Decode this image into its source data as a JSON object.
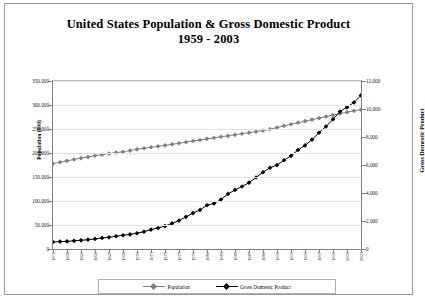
{
  "title": {
    "line1": "United States Population & Gross Domestic Product",
    "line2": "1959 - 2003"
  },
  "legend": {
    "items": [
      {
        "label": "Population",
        "color": "#808080"
      },
      {
        "label": "Gross Domestic Product",
        "color": "#000000"
      }
    ]
  },
  "chart_data": {
    "type": "line",
    "title": "United States Population & Gross Domestic Product 1959 - 2003",
    "xlabel": "",
    "ylabel": "Population (000)",
    "ylabel_right": "Gross Domestic Product",
    "grid": true,
    "legend_position": "bottom",
    "x": [
      1959,
      1960,
      1961,
      1962,
      1963,
      1964,
      1965,
      1966,
      1967,
      1968,
      1969,
      1970,
      1971,
      1972,
      1973,
      1974,
      1975,
      1976,
      1977,
      1978,
      1979,
      1980,
      1981,
      1982,
      1983,
      1984,
      1985,
      1986,
      1987,
      1988,
      1989,
      1990,
      1991,
      1992,
      1993,
      1994,
      1995,
      1996,
      1997,
      1998,
      1999,
      2000,
      2001,
      2002,
      2003
    ],
    "xticks": [
      1959,
      1961,
      1963,
      1965,
      1967,
      1969,
      1971,
      1973,
      1975,
      1977,
      1979,
      1981,
      1983,
      1985,
      1987,
      1989,
      1991,
      1993,
      1995,
      1997,
      1999,
      2001,
      2003
    ],
    "yticks_left": [
      "0",
      "50,000",
      "100,000",
      "150,000",
      "200,000",
      "250,000",
      "300,000",
      "350,000"
    ],
    "yticks_right": [
      "0",
      "2,000",
      "4,000",
      "6,000",
      "8,000",
      "10,000",
      "12,000"
    ],
    "ylim_left": [
      0,
      350000
    ],
    "ylim_right": [
      0,
      12000
    ],
    "series": [
      {
        "name": "Population",
        "axis": "left",
        "color": "#808080",
        "marker": "diamond",
        "values": [
          177830,
          180671,
          183691,
          186538,
          189242,
          191889,
          194303,
          196560,
          198712,
          200706,
          202677,
          205052,
          207661,
          209896,
          211909,
          213854,
          215973,
          218035,
          220239,
          222585,
          225055,
          227225,
          229466,
          231664,
          233792,
          235825,
          237924,
          240133,
          242289,
          244499,
          246819,
          249623,
          252981,
          256514,
          259919,
          263126,
          266278,
          269394,
          272647,
          275854,
          279040,
          282172,
          285082,
          287804,
          290326
        ]
      },
      {
        "name": "Gross Domestic Product",
        "axis": "right",
        "color": "#000000",
        "marker": "diamond",
        "values": [
          506,
          527,
          545,
          586,
          618,
          664,
          719,
          788,
          833,
          910,
          985,
          1040,
          1128,
          1241,
          1386,
          1501,
          1638,
          1825,
          2031,
          2295,
          2563,
          2790,
          3128,
          3255,
          3537,
          3933,
          4220,
          4463,
          4740,
          5104,
          5484,
          5803,
          5996,
          6338,
          6657,
          7072,
          7398,
          7817,
          8304,
          8747,
          9268,
          9817,
          10128,
          10470,
          10971
        ]
      }
    ]
  }
}
